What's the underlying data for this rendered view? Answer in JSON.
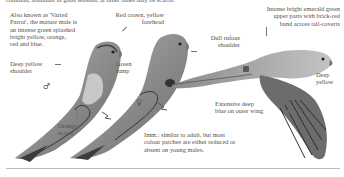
{
  "top_text": "common, abundant in good seasons, at other times may be scarce.",
  "labels": {
    "intro": "Also known as 'Varied\nParrot', the mature male is\nan intense green splashed\nbright yellow, orange,\nred and blue.",
    "red_crown": "Red crown, yellow\nforehead",
    "emerald": "Intense bright emerald green\nupper parts with brick-red\nband across tail-coverts",
    "dull_rufous": "Dull rufous\nshoulder",
    "deep_yellow_shoulder": "Deep yellow\nshoulder",
    "green_rump": "Green\nrump",
    "deep_yellow": "Deep\nyellow",
    "outer_wing": "Extensive deep\nblue on outer wing",
    "orange_red": "Orange\nto red",
    "immature": "Imm.: similar to adult, but most\ncolour patches are either reduced or\nabsent on young males."
  },
  "symbols": {
    "male": "♂",
    "female": "♀"
  },
  "colors": {
    "text": "#505050",
    "bird_body": "#9a9a9a",
    "bird_dark": "#3a3a3a",
    "rule": "#bdbdbd"
  }
}
